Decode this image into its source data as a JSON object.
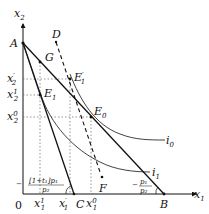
{
  "axes": {
    "x_label": "x",
    "x_sub": "1",
    "y_label": "x",
    "y_sub": "2",
    "origin": "0"
  },
  "points": {
    "A": "A",
    "B": "B",
    "C": "C",
    "D": "D",
    "F": "F",
    "G": "G",
    "E0": {
      "main": "E",
      "sub": "0"
    },
    "E1": {
      "main": "E",
      "sub": "1"
    },
    "E1p": {
      "main": "E",
      "sup": "′",
      "sub": "1"
    }
  },
  "curves": {
    "i0": {
      "main": "i",
      "sub": "0"
    },
    "i1": {
      "main": "i",
      "sub": "1"
    }
  },
  "y_ticks": [
    {
      "main": "x",
      "sup": "′",
      "sub": "2"
    },
    {
      "main": "x",
      "sup": "1",
      "sub": "2"
    },
    {
      "main": "x",
      "sup": "0",
      "sub": "2"
    }
  ],
  "x_ticks": [
    {
      "main": "x",
      "sup": "1",
      "sub": "1"
    },
    {
      "main": "x",
      "sup": "′",
      "sub": "1"
    },
    {
      "main": "x",
      "sup": "0",
      "sub": "1"
    }
  ],
  "slopes": {
    "taxed": {
      "numerator": "[1+t₁]p₁",
      "denominator": "p₂",
      "sign": "−"
    },
    "original": {
      "numerator": "p₁",
      "denominator": "p₂",
      "sign": "−"
    }
  },
  "colors": {
    "line": "#111111",
    "dotted": "#555555"
  }
}
